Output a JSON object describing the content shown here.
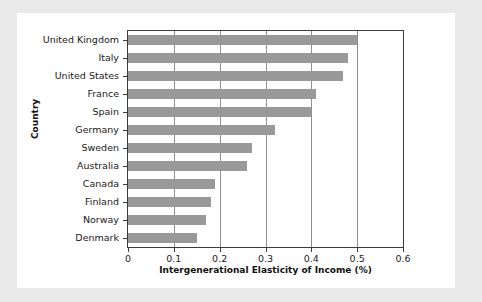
{
  "chart_data": {
    "type": "bar",
    "orientation": "horizontal",
    "title": "",
    "xlabel": "Intergenerational Elasticity of Income (%)",
    "ylabel": "Country",
    "categories": [
      "United Kingdom",
      "Italy",
      "United States",
      "France",
      "Spain",
      "Germany",
      "Sweden",
      "Australia",
      "Canada",
      "Finland",
      "Norway",
      "Denmark"
    ],
    "values": [
      0.5,
      0.48,
      0.47,
      0.41,
      0.4,
      0.32,
      0.27,
      0.26,
      0.19,
      0.18,
      0.17,
      0.15
    ],
    "xlim": [
      0,
      0.6
    ],
    "xticks": [
      0,
      0.1,
      0.2,
      0.3,
      0.4,
      0.5,
      0.6
    ],
    "xtick_labels": [
      "0",
      "0.1",
      "0.2",
      "0.3",
      "0.4",
      "0.5",
      "0.6"
    ],
    "grid": "vertical",
    "legend": "none",
    "bar_color": "#999999",
    "frame_color": "#3b3b3b",
    "gridline_color": "#8f8f8f",
    "background_color": "#ffffff",
    "page_background_color": "#e9e9e9"
  }
}
